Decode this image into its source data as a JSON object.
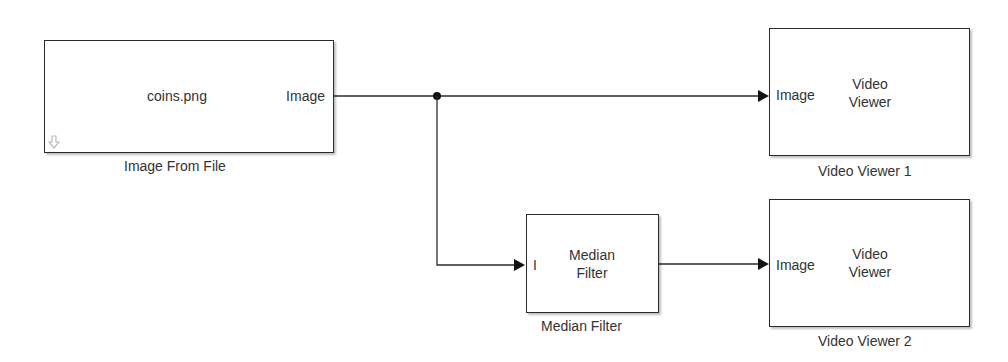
{
  "blocks": {
    "image_from_file": {
      "name": "Image From File",
      "content": "coins.png",
      "output_port": "Image"
    },
    "median_filter": {
      "name": "Median Filter",
      "content_line1": "Median",
      "content_line2": "Filter",
      "input_port": "I"
    },
    "video_viewer_1": {
      "name": "Video Viewer 1",
      "content_line1": "Video",
      "content_line2": "Viewer",
      "input_port": "Image"
    },
    "video_viewer_2": {
      "name": "Video Viewer 2",
      "content_line1": "Video",
      "content_line2": "Viewer",
      "input_port": "Image"
    }
  },
  "colors": {
    "line": "#2b2b2b",
    "block_border": "#2b2b2b",
    "text": "#333333",
    "background": "#ffffff"
  }
}
